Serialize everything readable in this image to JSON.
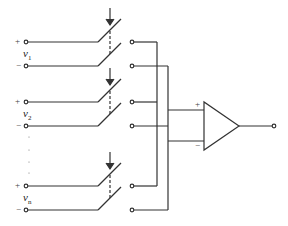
{
  "diagram": {
    "type": "circuit",
    "inputs": [
      {
        "id": "v1",
        "label": "v",
        "sub": "1",
        "plus": "+",
        "minus": "−"
      },
      {
        "id": "v2",
        "label": "v",
        "sub": "2",
        "plus": "+",
        "minus": "−"
      },
      {
        "id": "vn",
        "label": "v",
        "sub": "n",
        "plus": "+",
        "minus": "−"
      }
    ],
    "opamp": {
      "plus_label": "+",
      "minus_label": "−"
    },
    "colors": {
      "stroke": "#333333",
      "background": "#ffffff"
    }
  }
}
